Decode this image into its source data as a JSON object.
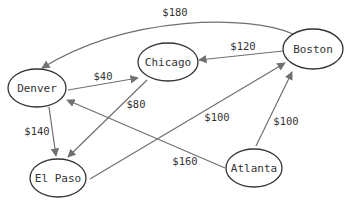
{
  "diagram": {
    "type": "directed-graph",
    "colors": {
      "node_stroke": "#333333",
      "edge_stroke": "#707070",
      "text": "#333333",
      "background": "#ffffff"
    },
    "nodes": [
      {
        "id": "denver",
        "label": "Denver"
      },
      {
        "id": "chicago",
        "label": "Chicago"
      },
      {
        "id": "boston",
        "label": "Boston"
      },
      {
        "id": "elpaso",
        "label": "El Paso"
      },
      {
        "id": "atlanta",
        "label": "Atlanta"
      }
    ],
    "edges": [
      {
        "from": "boston",
        "to": "denver",
        "label": "$180"
      },
      {
        "from": "boston",
        "to": "chicago",
        "label": "$120"
      },
      {
        "from": "denver",
        "to": "chicago",
        "label": "$40"
      },
      {
        "from": "chicago",
        "to": "elpaso",
        "label": "$80"
      },
      {
        "from": "denver",
        "to": "elpaso",
        "label": "$140"
      },
      {
        "from": "elpaso",
        "to": "boston",
        "label": "$100"
      },
      {
        "from": "atlanta",
        "to": "boston",
        "label": "$100"
      },
      {
        "from": "atlanta",
        "to": "denver",
        "label": "$160"
      }
    ]
  }
}
